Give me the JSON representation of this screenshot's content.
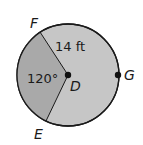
{
  "diagram": {
    "type": "circle-sector",
    "center": {
      "label": "D"
    },
    "points": [
      {
        "label": "F"
      },
      {
        "label": "E"
      },
      {
        "label": "G"
      }
    ],
    "radius_label": "14 ft",
    "angle_label": "120°",
    "colors": {
      "sector_shade": "#a9a9a9",
      "circle_fill": "#c6c6c6",
      "stroke": "#1a1a1a"
    }
  }
}
